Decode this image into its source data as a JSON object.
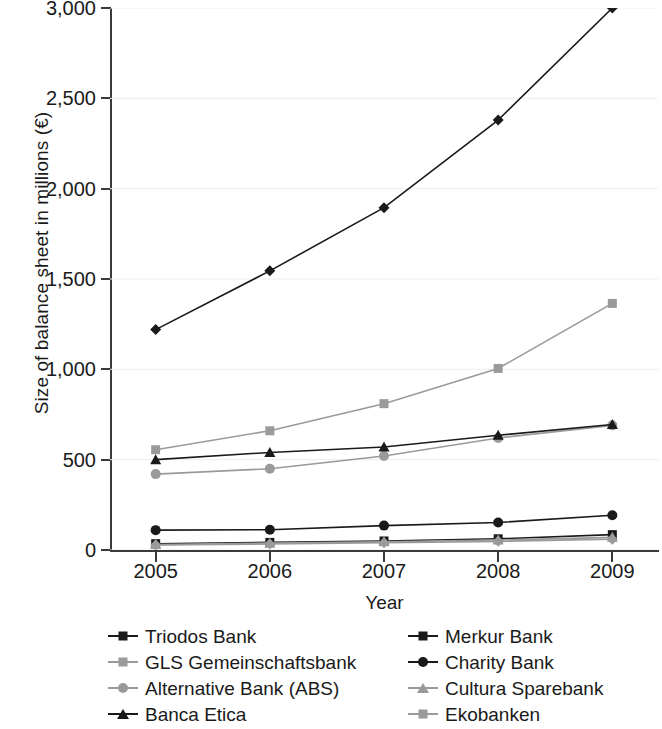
{
  "chart_data": {
    "type": "line",
    "title": "",
    "xlabel": "Year",
    "ylabel": "Size of balance sheet in millions (€)",
    "x": [
      2005,
      2006,
      2007,
      2008,
      2009
    ],
    "xtick_labels": [
      "2005",
      "2006",
      "2007",
      "2008",
      "2009"
    ],
    "ytick_labels": [
      "0",
      "500",
      "1,000",
      "1,500",
      "2,000",
      "2,500",
      "3,000"
    ],
    "ytick_values": [
      0,
      500,
      1000,
      1500,
      2000,
      2500,
      3000
    ],
    "ylim": [
      0,
      3000
    ],
    "xlim": [
      2004.6,
      2009.4
    ],
    "grid": "horizontal",
    "legend_position": "below-plot",
    "legend_columns": 2,
    "series": [
      {
        "name": "Triodos Bank",
        "values": [
          1220,
          1545,
          1895,
          2380,
          3000
        ],
        "color": "#1a1a1a",
        "marker": "diamond"
      },
      {
        "name": "GLS Gemeinschaftsbank",
        "values": [
          555,
          660,
          810,
          1005,
          1365
        ],
        "color": "#9a9a9a",
        "marker": "square"
      },
      {
        "name": "Alternative Bank (ABS)",
        "values": [
          420,
          450,
          520,
          620,
          690
        ],
        "color": "#9a9a9a",
        "marker": "circle"
      },
      {
        "name": "Banca Etica",
        "values": [
          500,
          540,
          570,
          635,
          695
        ],
        "color": "#1a1a1a",
        "marker": "triangle"
      },
      {
        "name": "Merkur Bank",
        "values": [
          35,
          42,
          50,
          62,
          85
        ],
        "color": "#1a1a1a",
        "marker": "square"
      },
      {
        "name": "Charity Bank",
        "values": [
          110,
          112,
          135,
          152,
          192
        ],
        "color": "#1a1a1a",
        "marker": "circle"
      },
      {
        "name": "Cultura Sparebank",
        "values": [
          30,
          38,
          45,
          55,
          70
        ],
        "color": "#9a9a9a",
        "marker": "triangle"
      },
      {
        "name": "Ekobanken",
        "values": [
          28,
          33,
          40,
          48,
          60
        ],
        "color": "#9a9a9a",
        "marker": "diamond"
      }
    ]
  },
  "legend": {
    "entries": [
      {
        "label": "Triodos Bank",
        "color": "#1a1a1a",
        "marker": "diamond"
      },
      {
        "label": "Merkur Bank",
        "color": "#1a1a1a",
        "marker": "square"
      },
      {
        "label": "GLS Gemeinschaftsbank",
        "color": "#9a9a9a",
        "marker": "square"
      },
      {
        "label": "Charity Bank",
        "color": "#1a1a1a",
        "marker": "circle"
      },
      {
        "label": "Alternative Bank (ABS)",
        "color": "#9a9a9a",
        "marker": "circle"
      },
      {
        "label": "Cultura Sparebank",
        "color": "#9a9a9a",
        "marker": "triangle"
      },
      {
        "label": "Banca Etica",
        "color": "#1a1a1a",
        "marker": "triangle"
      },
      {
        "label": "Ekobanken",
        "color": "#9a9a9a",
        "marker": "diamond"
      }
    ]
  },
  "style": {
    "axis_color": "#3a3a3a",
    "grid_color": "#ededed",
    "background": "#ffffff",
    "dark_series": "#1a1a1a",
    "light_series": "#9a9a9a"
  }
}
